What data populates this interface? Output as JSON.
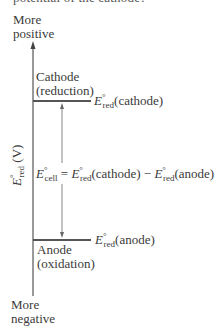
{
  "header": {
    "cutoff_text": "potential of the cathode?"
  },
  "axis": {
    "top_label_line1": "More",
    "top_label_line2": "positive",
    "bottom_label_line1": "More",
    "bottom_label_line2": "negative",
    "y_label_symbol": "E",
    "y_label_sup": "°",
    "y_label_sub": "red",
    "y_label_unit": "(V)"
  },
  "cathode": {
    "name": "Cathode",
    "process": "(reduction)",
    "level_symbol": "E",
    "level_sup": "°",
    "level_sub": "red",
    "level_arg": "(cathode)"
  },
  "anode": {
    "name": "Anode",
    "process": "(oxidation)",
    "level_symbol": "E",
    "level_sup": "°",
    "level_sub": "red",
    "level_arg": "(anode)"
  },
  "equation": {
    "lhs_symbol": "E",
    "lhs_sup": "°",
    "lhs_sub": "cell",
    "equals": " = ",
    "t1_symbol": "E",
    "t1_sup": "°",
    "t1_sub": "red",
    "t1_arg": "(cathode)",
    "minus": " − ",
    "t2_symbol": "E",
    "t2_sup": "°",
    "t2_sub": "red",
    "t2_arg": "(anode)"
  },
  "colors": {
    "line": "#555555",
    "text": "#3a3a3a"
  }
}
